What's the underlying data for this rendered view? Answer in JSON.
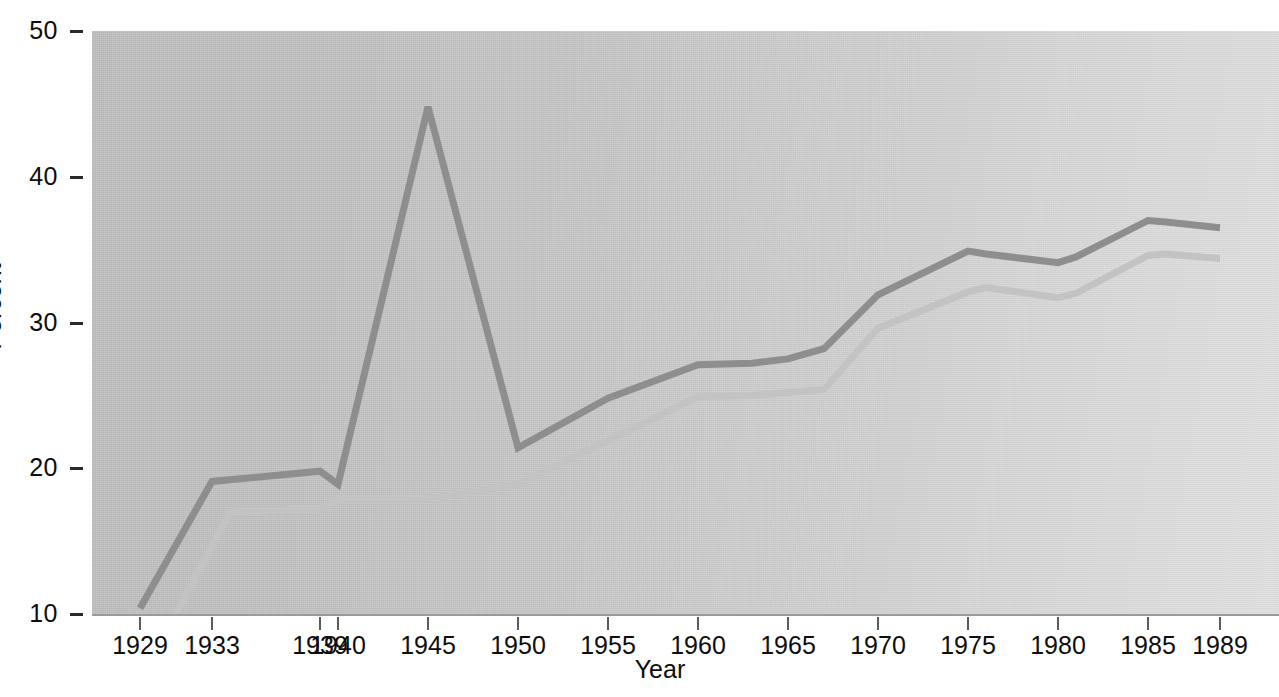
{
  "chart_data": {
    "type": "line",
    "title": "",
    "subtitle": "",
    "xlabel": "Year",
    "ylabel": "Percent",
    "xlim": [
      1928,
      1990
    ],
    "ylim": [
      10,
      50
    ],
    "grid": false,
    "legend_position": "none",
    "x_tick_labels": [
      "1929",
      "1933",
      "1939",
      "1940",
      "1945",
      "1950",
      "1955",
      "1960",
      "1965",
      "1970",
      "1975",
      "1980",
      "1985",
      "1989"
    ],
    "x_tick_values": [
      1929,
      1933,
      1939,
      1940,
      1945,
      1950,
      1955,
      1960,
      1965,
      1970,
      1975,
      1980,
      1985,
      1989
    ],
    "y_tick_labels": [
      "10",
      "20",
      "30",
      "40",
      "50"
    ],
    "y_tick_values": [
      10,
      20,
      30,
      40,
      50
    ],
    "series": [
      {
        "name": "upper-line",
        "color": "#8e8e8e",
        "x": [
          1929,
          1933,
          1939,
          1940,
          1945,
          1950,
          1955,
          1960,
          1963,
          1965,
          1967,
          1970,
          1975,
          1976,
          1980,
          1981,
          1985,
          1986,
          1989
        ],
        "values": [
          10.4,
          19.1,
          19.8,
          18.9,
          44.8,
          21.4,
          24.8,
          27.1,
          27.2,
          27.5,
          28.2,
          31.9,
          34.9,
          34.7,
          34.1,
          34.5,
          37.0,
          36.9,
          36.5
        ]
      },
      {
        "name": "lower-line",
        "color": "#c3c3c3",
        "x": [
          1931,
          1934,
          1939,
          1940,
          1945,
          1950,
          1955,
          1960,
          1963,
          1965,
          1967,
          1970,
          1975,
          1976,
          1980,
          1981,
          1985,
          1986,
          1989
        ],
        "values": [
          10.0,
          17.0,
          17.2,
          17.9,
          17.9,
          18.9,
          21.9,
          24.9,
          25.0,
          25.2,
          25.4,
          29.6,
          32.1,
          32.4,
          31.7,
          32.0,
          34.6,
          34.7,
          34.4
        ]
      }
    ]
  },
  "axes": {
    "y_title": "Percent",
    "x_title": "Year"
  },
  "colors": {
    "upper_line": "#8e8e8e",
    "lower_line": "#c3c3c3",
    "plot_background": "#c4c4c4",
    "tick": "#2a2a2a",
    "text": "#0d0d0d"
  }
}
